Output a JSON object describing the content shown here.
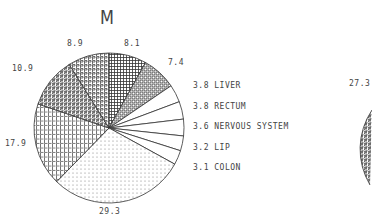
{
  "chart_data": {
    "type": "pie",
    "title": "M",
    "slices": [
      {
        "label": "",
        "value": 8.1,
        "pattern": "grid"
      },
      {
        "label": "",
        "value": 7.4,
        "pattern": "B"
      },
      {
        "label": "LIVER",
        "value": 3.8,
        "pattern": "none"
      },
      {
        "label": "RECTUM",
        "value": 3.8,
        "pattern": "none"
      },
      {
        "label": "NERVOUS SYSTEM",
        "value": 3.6,
        "pattern": "none"
      },
      {
        "label": "LIP",
        "value": 3.2,
        "pattern": "none"
      },
      {
        "label": "COLON",
        "value": 3.1,
        "pattern": "none"
      },
      {
        "label": "",
        "value": 29.3,
        "pattern": "dots"
      },
      {
        "label": "",
        "value": 17.9,
        "pattern": "L"
      },
      {
        "label": "",
        "value": 10.9,
        "pattern": "S"
      },
      {
        "label": "",
        "value": 8.9,
        "pattern": "P"
      }
    ],
    "outer_labels": [
      "8.9",
      "8.1",
      "7.4",
      "10.9",
      "17.9",
      "29.3"
    ],
    "legend": [
      {
        "value": "3.8",
        "label": "LIVER"
      },
      {
        "value": "3.8",
        "label": "RECTUM"
      },
      {
        "value": "3.6",
        "label": "NERVOUS SYSTEM"
      },
      {
        "value": "3.2",
        "label": "LIP"
      },
      {
        "value": "3.1",
        "label": "COLON"
      }
    ],
    "second_chart_partial_label": "27.3"
  },
  "labels": {
    "title": "M",
    "v89": "8.9",
    "v81": "8.1",
    "v74": "7.4",
    "v109": "10.9",
    "v179": "17.9",
    "v293": "29.3",
    "v273": "27.3"
  },
  "legend": [
    {
      "text": "3.8 LIVER"
    },
    {
      "text": "3.8 RECTUM"
    },
    {
      "text": "3.6 NERVOUS SYSTEM"
    },
    {
      "text": "3.2 LIP"
    },
    {
      "text": "3.1 COLON"
    }
  ]
}
